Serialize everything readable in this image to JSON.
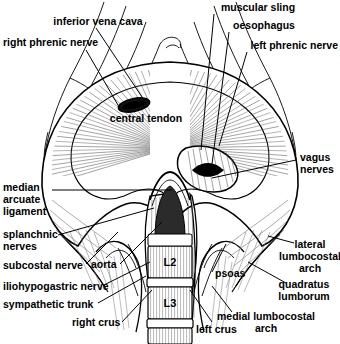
{
  "figure": {
    "domain": "anatomical-line-diagram",
    "background_color": "#ffffff",
    "ink_color": "#000000",
    "shading_color": "#9a9a9a"
  },
  "labels": {
    "inferior_vena_cava": "inferior vena cava",
    "right_phrenic_nerve": "right phrenic nerve",
    "muscular_sling": "muscular sling",
    "oesophagus": "oesophagus",
    "left_phrenic_nerve": "left phrenic nerve",
    "central_tendon": "central tendon",
    "vagus_line1": "vagus",
    "vagus_line2": "nerves",
    "median_line1": "median",
    "median_line2": "arcuate",
    "median_line3": "ligament",
    "splanchnic_line1": "splanchnic",
    "splanchnic_line2": "nerves",
    "subcostal_nerve": "subcostal nerve",
    "iliohypogastric_nerve": "iliohypogastric nerve",
    "sympathetic_trunk": "sympathetic trunk",
    "right_crus": "right crus",
    "aorta": "aorta",
    "psoas": "psoas",
    "left_crus": "left crus",
    "lateral_line1": "lateral",
    "lateral_line2": "lumbocostal",
    "lateral_line3": "arch",
    "quadratus_line1": "quadratus",
    "quadratus_line2": "lumborum",
    "medial_line1": "medial lumbocostal",
    "medial_line2": "arch",
    "vertebra_l2": "L2",
    "vertebra_l3": "L3"
  }
}
